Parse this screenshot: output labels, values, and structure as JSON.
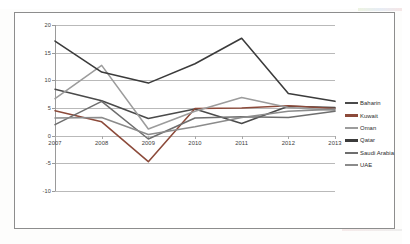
{
  "chart_data": {
    "type": "line",
    "title": "",
    "subtitle": "",
    "xlabel": "",
    "ylabel": "",
    "categories": [
      "2007",
      "2008",
      "2009",
      "2010",
      "2011",
      "2012",
      "2013"
    ],
    "x": [
      2007,
      2008,
      2009,
      2010,
      2011,
      2012,
      2013
    ],
    "ylim": [
      -10,
      20
    ],
    "yticks": [
      20,
      15,
      10,
      5,
      0,
      -5,
      -10
    ],
    "ytick_labels": [
      "20",
      "15",
      "10",
      "5",
      "0",
      "-5",
      "-10"
    ],
    "grid": true,
    "grid_orientation": "horizontal",
    "legend_position": "right",
    "series": [
      {
        "name": "Baharin",
        "color": "#4a4a4a",
        "values": [
          8.4,
          6.3,
          3.1,
          4.8,
          2.2,
          5.3,
          5.1
        ]
      },
      {
        "name": "Kuwait",
        "color": "#8c4a3a",
        "values": [
          4.5,
          2.5,
          -4.7,
          4.9,
          5.0,
          5.4,
          4.9
        ]
      },
      {
        "name": "Oman",
        "color": "#9c9c9c",
        "values": [
          6.7,
          12.7,
          1.2,
          4.4,
          6.9,
          5.1,
          4.6
        ]
      },
      {
        "name": "Qatar",
        "color": "#3b3b3b",
        "values": [
          17.1,
          11.5,
          9.5,
          13.0,
          17.6,
          7.6,
          6.2
        ]
      },
      {
        "name": "Saudi Arabia",
        "color": "#6e6e6e",
        "values": [
          2.0,
          6.2,
          -0.6,
          3.2,
          3.4,
          3.3,
          4.4
        ]
      },
      {
        "name": "UAE",
        "color": "#8b8b8b",
        "values": [
          3.2,
          3.3,
          0.2,
          1.6,
          3.3,
          4.4,
          4.8
        ]
      }
    ]
  },
  "legend": {
    "entries": [
      {
        "label": "Baharin",
        "color": "#4a4a4a"
      },
      {
        "label": "Kuwait",
        "color": "#8c4a3a"
      },
      {
        "label": "Oman",
        "color": "#9c9c9c"
      },
      {
        "label": "Qatar",
        "color": "#3b3b3b"
      },
      {
        "label": "Saudi Arabia",
        "color": "#6e6e6e"
      },
      {
        "label": "UAE",
        "color": "#8b8b8b"
      }
    ]
  },
  "colors": {
    "plot_background": "#ffffff",
    "page_background": "#fdfdfc",
    "frame_border": "#8d8d8d",
    "gridline": "#b9b9b9",
    "axis": "#9a9a9a",
    "tick_text": "#3c3c3c"
  }
}
